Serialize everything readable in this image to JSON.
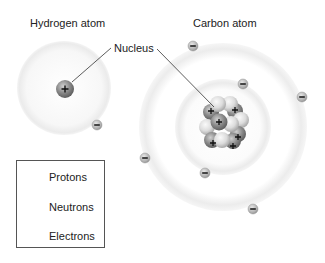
{
  "title_hydrogen": "Hydrogen atom",
  "title_carbon": "Carbon atom",
  "nucleus_label": "Nucleus",
  "legend": {
    "items": [
      {
        "label": "Protons",
        "icon": "proton-icon"
      },
      {
        "label": "Neutrons",
        "icon": "neutron-icon"
      },
      {
        "label": "Electrons",
        "icon": "electron-icon"
      }
    ]
  },
  "hydrogen": {
    "protons": 1,
    "neutrons": 0,
    "electrons": 1
  },
  "carbon": {
    "protons": 6,
    "neutrons": 6,
    "electrons": 6,
    "inner_shell_electrons": 2,
    "outer_shell_electrons": 4
  },
  "colors": {
    "proton": "#8a8a8a",
    "neutron": "#d8d8d8",
    "electron": "#b0b0b0",
    "orbit": "#ececec"
  }
}
